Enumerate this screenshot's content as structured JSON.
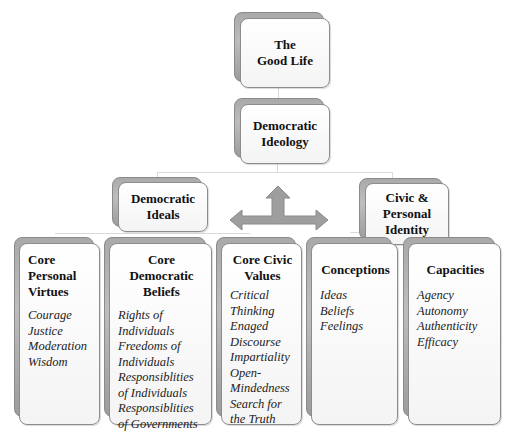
{
  "diagram": {
    "root": {
      "title": "The\nGood Life"
    },
    "level1": {
      "title": "Democratic\nIdeology"
    },
    "level2": [
      {
        "title": "Democratic\nIdeals"
      },
      {
        "title": "Civic &\nPersonal\nIdentity"
      }
    ],
    "arrow": {
      "type": "three-way arrow",
      "directions": [
        "left",
        "up",
        "right"
      ],
      "color": "#9e9e9e"
    },
    "leaves": [
      {
        "title": "Core\nPersonal\nVirtues",
        "items": [
          "Courage",
          "Justice",
          "Moderation",
          "Wisdom"
        ]
      },
      {
        "title": "Core\nDemocratic\nBeliefs",
        "items": [
          "Rights of",
          "Individuals",
          "Freedoms of",
          "Individuals",
          "Responsiblities",
          "of Individuals",
          "Responsiblities",
          "of Governments"
        ]
      },
      {
        "title": "Core Civic\nValues",
        "items": [
          "Critical",
          "Thinking",
          "Enaged",
          "Discourse",
          "Impartiality",
          "Open-",
          "Mindedness",
          "Search for",
          "the Truth"
        ]
      },
      {
        "title": "Conceptions",
        "items": [
          "Ideas",
          "Beliefs",
          "Feelings"
        ]
      },
      {
        "title": "Capacities",
        "items": [
          "Agency",
          "Autonomy",
          "Authenticity",
          "Efficacy"
        ]
      }
    ],
    "colors": {
      "box_fill": "#f7f7f7",
      "box_border": "#8c8c8c",
      "box_shadow_layer": "#a9a9a9",
      "connector": "#d9d9d9",
      "arrow": "#9e9e9e"
    }
  }
}
